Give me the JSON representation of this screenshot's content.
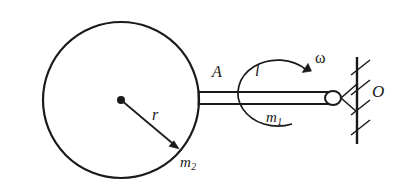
{
  "figure": {
    "background_color": "#ffffff",
    "stroke_color": "#1a1a1a",
    "width": 407,
    "height": 193
  },
  "labels": {
    "rod_attachment_point": "A",
    "rod_length": "l",
    "rod_mass": "m",
    "rod_mass_subscript": "1",
    "disk_radius": "r",
    "disk_mass": "m",
    "disk_mass_subscript": "2",
    "angular_velocity": "ω",
    "pivot_point": "O"
  },
  "geometry": {
    "disk": {
      "center_x": 121,
      "center_y": 100,
      "radius": 78,
      "fill": "none",
      "center_dot_radius": 4
    },
    "radius_arrow": {
      "from_x": 121,
      "from_y": 100,
      "to_x": 178,
      "to_y": 148
    },
    "rod": {
      "left_x": 198,
      "right_x": 330,
      "top_y": 92,
      "bottom_y": 104
    },
    "pin_joint": {
      "center_x": 333,
      "center_y": 98,
      "radius_x": 8,
      "radius_y": 7
    },
    "support_triangle": {
      "apex_x": 341,
      "apex_y": 98,
      "base_x": 357,
      "base_top_y": 84,
      "base_bottom_y": 112
    },
    "wall": {
      "x": 357,
      "top_y": 57,
      "bottom_y": 144,
      "hatch_count": 4
    },
    "omega_arc": {
      "center_x": 306,
      "center_y": 98,
      "radius": 40,
      "direction": "counterclockwise",
      "arrowhead_at": "top"
    }
  },
  "icons": {
    "pivot": "pin-joint-icon",
    "wall": "hatched-wall-icon",
    "rotation": "angular-velocity-arc-icon",
    "radius": "radius-arrow-icon"
  }
}
